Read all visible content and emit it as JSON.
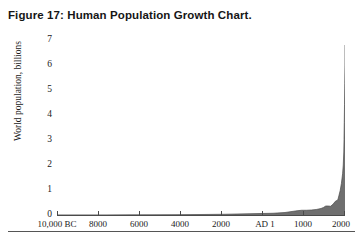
{
  "figure": {
    "caption": "Figure 17:  Human Population Growth Chart."
  },
  "chart_data": {
    "type": "area",
    "title": "Human Population Growth Chart",
    "xlabel": "",
    "ylabel": "World population, billions",
    "ylim": [
      0,
      7
    ],
    "xlim": [
      -10000,
      2000
    ],
    "grid": false,
    "legend": null,
    "y_ticks": [
      7,
      6,
      5,
      4,
      3,
      2,
      1,
      0
    ],
    "y_tick_labels": [
      "7",
      "6",
      "5",
      "4",
      "3",
      "2",
      "1",
      "0"
    ],
    "x_ticks": [
      -10000,
      -8000,
      -6000,
      -4000,
      -2000,
      1,
      1000,
      2000
    ],
    "x_tick_labels": [
      "10,000 BC",
      "8000",
      "6000",
      "4000",
      "2000",
      "AD 1",
      "1000",
      "2000"
    ],
    "series_name": "World population",
    "fill_color": "#6f6f6f",
    "line_color": "#4a4a4a",
    "x": [
      -10000,
      -9000,
      -8000,
      -7000,
      -6000,
      -5000,
      -4000,
      -3000,
      -2000,
      -1000,
      -500,
      1,
      200,
      400,
      600,
      800,
      1000,
      1100,
      1200,
      1300,
      1400,
      1500,
      1600,
      1700,
      1750,
      1800,
      1850,
      1900,
      1927,
      1950,
      1960,
      1970,
      1980,
      1990,
      1999,
      2000
    ],
    "y": [
      0.004,
      0.005,
      0.005,
      0.007,
      0.01,
      0.015,
      0.02,
      0.03,
      0.05,
      0.07,
      0.1,
      0.17,
      0.19,
      0.19,
      0.2,
      0.22,
      0.26,
      0.3,
      0.36,
      0.36,
      0.35,
      0.43,
      0.55,
      0.6,
      0.79,
      0.98,
      1.26,
      1.65,
      2.0,
      2.52,
      3.02,
      3.7,
      4.43,
      5.27,
      6.0,
      6.8
    ],
    "units": "billions",
    "peak_value": 6.8,
    "peak_year": 2000
  }
}
